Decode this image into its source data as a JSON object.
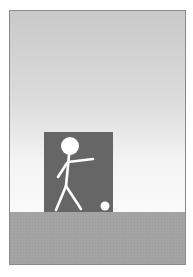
{
  "scene": {
    "description": "Stick figure about to kick a ball in front of a dark rectangle",
    "colors": {
      "sky_top": "#c9c9c9",
      "sky_bottom": "#fafafa",
      "backdrop": "#666666",
      "ground": "#a4a4a4",
      "figure": "#ffffff",
      "ball": "#ffffff",
      "border": "#8a8a8a"
    },
    "elements": [
      "sky",
      "dark-backdrop",
      "stick-figure",
      "ball",
      "ground"
    ]
  }
}
